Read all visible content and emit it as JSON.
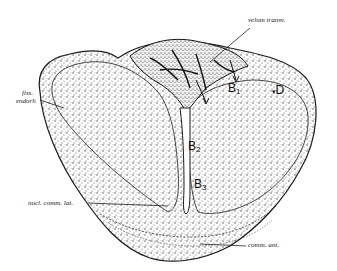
{
  "figure": {
    "type": "anatomical cross-section illustration",
    "labels": {
      "velum": "velum transv.",
      "fiss": "fiss.",
      "endorh": "endorh",
      "nucl": "nucl. comm. lat.",
      "comm": "comm. ant.",
      "B1_letter": "B",
      "B1_sub": "1",
      "D": "D",
      "B2_letter": "B",
      "B2_sub": "2",
      "B3_letter": "B",
      "B3_sub": "3"
    }
  },
  "colors": {
    "ink": "#1a1a1a",
    "stipple": "#555555",
    "background": "#ffffff"
  }
}
